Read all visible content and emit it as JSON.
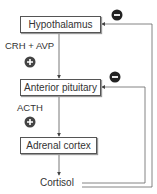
{
  "nodes": {
    "hypothalamus": "Hypothalamus",
    "anterior_pituitary": "Anterior pituitary",
    "adrenal_cortex": "Adrenal cortex",
    "cortisol": "Cortisol"
  },
  "labels": {
    "crh_avp": "CRH + AVP",
    "acth": "ACTH"
  },
  "signs": {
    "stimulate": "+",
    "inhibit": "−"
  },
  "colors": {
    "line": "#555555",
    "sign": "#222222"
  }
}
